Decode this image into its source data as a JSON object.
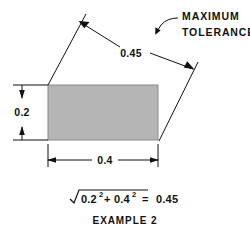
{
  "diagram": {
    "title": "EXAMPLE 2",
    "callout": {
      "line1": "MAXIMUM",
      "line2": "TOLERANCE"
    },
    "dimensions": {
      "height_label": "0.2",
      "width_label": "0.4",
      "diagonal_label": "0.45"
    },
    "shape": {
      "fill_color": "#b5b5b5",
      "stroke_color": "#8a8a8a"
    },
    "line_color": "#111111",
    "formula": {
      "radicand_term1_base": "0.2",
      "radicand_term1_exp": "2",
      "plus": "+",
      "radicand_term2_base": "0.4",
      "radicand_term2_exp": "2",
      "equals": "=",
      "result": "0.45"
    }
  }
}
